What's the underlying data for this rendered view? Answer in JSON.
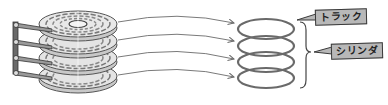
{
  "diagram": {
    "title": "",
    "platter_count": 4,
    "labels": {
      "track": "トラック",
      "cylinder": "シリンダ"
    },
    "colors": {
      "platter_fill": "#d9d9d9",
      "platter_stroke": "#555555",
      "track_ring": "#6a6a6a",
      "arm": "#8a8a8a",
      "arrow": "#7a7a7a",
      "label_bg": "#b8b8b8",
      "label_border": "#3a3a3a"
    },
    "components": [
      {
        "id": "platter-stack",
        "description": "stack of 4 disk platters with read/write head arms"
      },
      {
        "id": "arrows",
        "count": 4,
        "description": "curved arrows from each platter to its track ring"
      },
      {
        "id": "track-rings",
        "count": 4,
        "description": "stacked ellipse rings representing tracks"
      },
      {
        "id": "brace",
        "description": "curly brace grouping the rings as a cylinder"
      }
    ]
  }
}
